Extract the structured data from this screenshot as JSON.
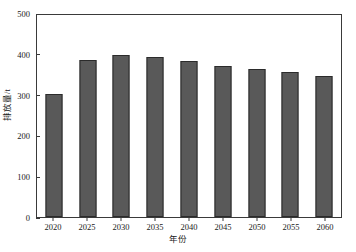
{
  "chart_data": {
    "type": "bar",
    "title": "",
    "subtitle": "",
    "xlabel": "年份",
    "ylabel": "排放量/t",
    "categories": [
      "2020",
      "2025",
      "2030",
      "2035",
      "2040",
      "2045",
      "2050",
      "2055",
      "2060"
    ],
    "values": [
      305,
      388,
      400,
      397,
      385,
      375,
      367,
      359,
      349
    ],
    "series": [
      {
        "name": "排放量",
        "values": [
          305,
          388,
          400,
          397,
          385,
          375,
          367,
          359,
          349
        ]
      }
    ],
    "ylim": [
      0,
      500
    ],
    "yticks": [
      0,
      100,
      200,
      300,
      400,
      500
    ],
    "ytick_labels": [
      "0",
      "100",
      "200",
      "300",
      "400",
      "500"
    ],
    "grid": false,
    "legend": null,
    "legend_position": "none",
    "bar_color": "#595959",
    "bar_edge_color": "#2b2b2b",
    "axis_color": "#3a3a3a",
    "background_color": "#ffffff",
    "annotations": []
  }
}
